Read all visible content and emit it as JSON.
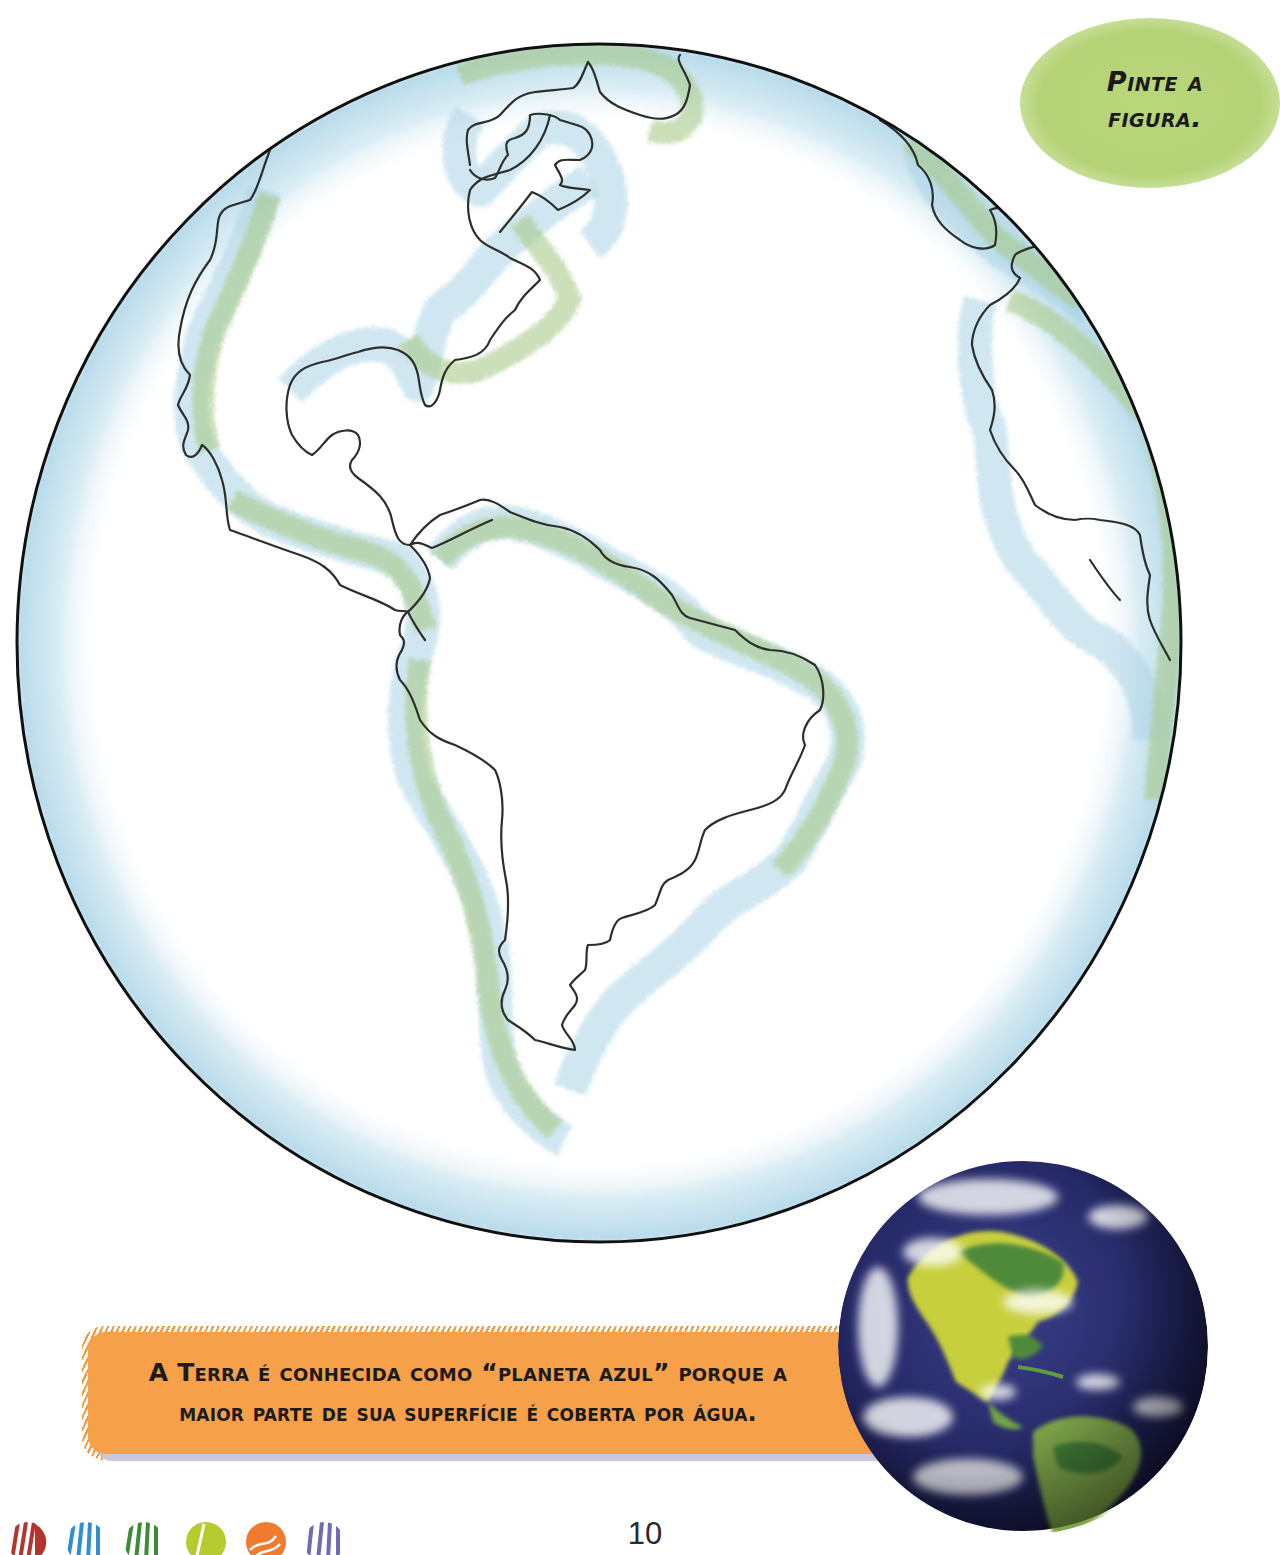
{
  "page": {
    "instruction": {
      "line1": "Pinte a",
      "line2": "figura.",
      "bubble_color": "#b5d376"
    },
    "coloring_figure": {
      "subject": "Globo terrestre para colorir (Américas)",
      "outline_color": "#1a1a1a",
      "ocean_tint": "#a9d3e6",
      "land_tint": "#a8c98a"
    },
    "fact_box": {
      "line1": "A Terra é conhecida como “planeta azul” porque a",
      "line2": "maior parte de sua superfície é coberta por água.",
      "background_color": "#f6a04a"
    },
    "earth_photo": {
      "alt": "Foto do planeta Terra vista do espaço"
    },
    "footer": {
      "page_number": "10",
      "decorative_dots": [
        {
          "color": "#b3352c"
        },
        {
          "color": "#2f8fd0"
        },
        {
          "color": "#3f8a3a"
        },
        {
          "color": "#b6cc2e"
        },
        {
          "color": "#f07a2e"
        },
        {
          "color": "#6d6cb5"
        }
      ]
    }
  }
}
